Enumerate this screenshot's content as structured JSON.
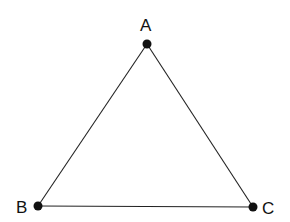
{
  "diagram": {
    "type": "triangle",
    "stroke_color": "#222222",
    "point_color": "#111111",
    "vertices": [
      {
        "id": "A",
        "label": "A",
        "x": 147,
        "y": 44
      },
      {
        "id": "B",
        "label": "B",
        "x": 38,
        "y": 206
      },
      {
        "id": "C",
        "label": "C",
        "x": 253,
        "y": 207
      }
    ],
    "edges": [
      [
        "A",
        "B"
      ],
      [
        "B",
        "C"
      ],
      [
        "C",
        "A"
      ]
    ]
  }
}
